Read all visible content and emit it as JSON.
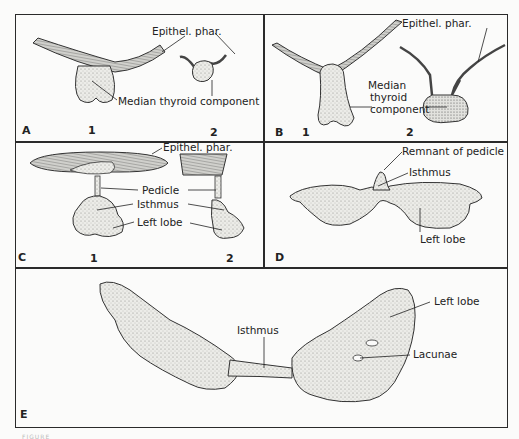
{
  "figure": {
    "panels": [
      {
        "id": "A",
        "letter": "A",
        "sub_numbers": [
          "1",
          "2"
        ],
        "labels": [
          "Epithel. phar.",
          "Median thyroid component"
        ]
      },
      {
        "id": "B",
        "letter": "B",
        "sub_numbers": [
          "1",
          "2"
        ],
        "labels": [
          "Epithel. phar.",
          "Median",
          "thyroid",
          "component"
        ]
      },
      {
        "id": "C",
        "letter": "C",
        "sub_numbers": [
          "1",
          "2"
        ],
        "labels": [
          "Epithel. phar.",
          "Pedicle",
          "Isthmus",
          "Left lobe"
        ]
      },
      {
        "id": "D",
        "letter": "D",
        "sub_numbers": [],
        "labels": [
          "Remnant of pedicle",
          "Isthmus",
          "Left lobe"
        ]
      },
      {
        "id": "E",
        "letter": "E",
        "sub_numbers": [],
        "labels": [
          "Isthmus",
          "Left lobe",
          "Lacunae"
        ]
      }
    ],
    "footer_text": "FIGURE"
  },
  "colors": {
    "line": "#2a2a2a",
    "background": "#fbfbfa",
    "tissue_fill": "#e4e4e0",
    "tissue_dark": "#bdbdb6"
  }
}
